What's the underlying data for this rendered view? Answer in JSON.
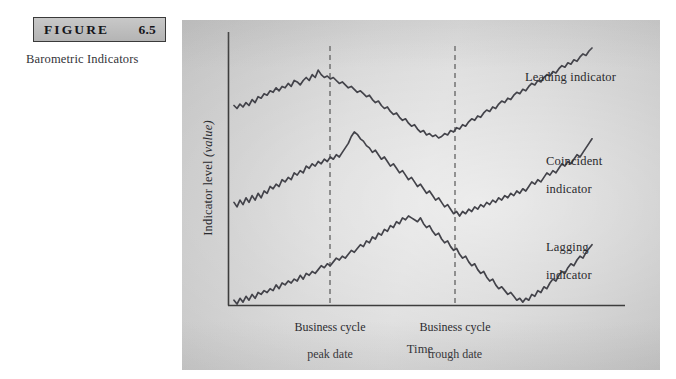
{
  "figure": {
    "header_word": "FIGURE",
    "number": "6.5",
    "caption": "Barometric Indicators"
  },
  "chart_data": {
    "type": "line",
    "title": "Barometric Indicators",
    "xlabel": "Time",
    "ylabel": "Indicator level (value)",
    "ylabel_plain": "Indicator level",
    "ylabel_italic": "(value)",
    "grid": false,
    "legend_position": "right-inline",
    "axis": {
      "x_range_note": "unlabeled time axis",
      "y_range_note": "unlabeled indicator level axis",
      "tick_labels": []
    },
    "annotations": [
      {
        "name": "business-cycle-peak",
        "label": "Business cycle\npeak date",
        "line1": "Business cycle",
        "line2": "peak date",
        "x_fraction": 0.256,
        "style": "dashed-vertical"
      },
      {
        "name": "business-cycle-trough",
        "label": "Business cycle\ntrough date",
        "line1": "Business cycle",
        "line2": "trough date",
        "x_fraction": 0.568,
        "style": "dashed-vertical"
      }
    ],
    "series": [
      {
        "name": "Leading indicator",
        "label_line1": "Leading indicator",
        "label_line2": "",
        "turning_points": {
          "peak_x_fraction": 0.17,
          "trough_x_fraction": 0.44
        },
        "note": "Peaks and troughs before the business cycle reference dates",
        "values": [
          76,
          74,
          77,
          75,
          78,
          76,
          80,
          78,
          82,
          81,
          84,
          83,
          86,
          85,
          88,
          86,
          89,
          88,
          91,
          89,
          93,
          92,
          90,
          93,
          95,
          93,
          97,
          95,
          100,
          97,
          95,
          96,
          94,
          95,
          93,
          91,
          92,
          90,
          88,
          89,
          87,
          85,
          86,
          84,
          82,
          83,
          80,
          78,
          79,
          76,
          74,
          75,
          72,
          70,
          71,
          68,
          66,
          67,
          64,
          62,
          63,
          60,
          58,
          59,
          56,
          57,
          55,
          56,
          54,
          55,
          57,
          56,
          59,
          58,
          61,
          60,
          63,
          62,
          65,
          67,
          66,
          69,
          68,
          71,
          73,
          72,
          75,
          74,
          77,
          79,
          78,
          81,
          80,
          83,
          85,
          84,
          87,
          86,
          89,
          91,
          90,
          93,
          92,
          95,
          97,
          96,
          99,
          98,
          101,
          103,
          102,
          105,
          104,
          107,
          106,
          109,
          111,
          110,
          113,
          115
        ]
      },
      {
        "name": "Coincident indicator",
        "label_line1": "Coincident",
        "label_line2": "indicator",
        "turning_points": {
          "peak_x_fraction": 0.256,
          "trough_x_fraction": 0.568
        },
        "note": "Peaks and troughs coincide with the business cycle reference dates",
        "values": [
          54,
          52,
          55,
          53,
          56,
          54,
          57,
          55,
          58,
          56,
          59,
          58,
          61,
          60,
          62,
          61,
          64,
          63,
          65,
          64,
          67,
          66,
          68,
          67,
          70,
          69,
          71,
          70,
          72,
          71,
          73,
          72,
          74,
          73,
          75,
          74,
          76,
          78,
          80,
          83,
          85,
          84,
          82,
          81,
          79,
          78,
          76,
          77,
          75,
          73,
          74,
          72,
          70,
          71,
          69,
          67,
          68,
          66,
          64,
          65,
          63,
          61,
          62,
          60,
          58,
          59,
          57,
          55,
          56,
          54,
          52,
          53,
          51,
          49,
          50,
          48,
          50,
          49,
          51,
          50,
          52,
          51,
          53,
          52,
          54,
          53,
          55,
          54,
          56,
          55,
          57,
          56,
          58,
          57,
          59,
          58,
          60,
          59,
          61,
          63,
          62,
          64,
          63,
          65,
          67,
          66,
          68,
          67,
          69,
          71,
          70,
          72,
          71,
          73,
          75,
          74,
          76,
          78,
          80,
          82
        ]
      },
      {
        "name": "Lagging indicator",
        "label_line1": "Lagging",
        "label_line2": "indicator",
        "turning_points": {
          "peak_x_fraction": 0.4,
          "trough_x_fraction": 0.7
        },
        "note": "Peaks and troughs after the business cycle reference dates",
        "values": [
          42,
          40,
          43,
          41,
          44,
          42,
          45,
          43,
          46,
          45,
          47,
          46,
          48,
          47,
          50,
          48,
          51,
          50,
          52,
          51,
          53,
          52,
          55,
          53,
          56,
          55,
          57,
          56,
          58,
          60,
          59,
          61,
          60,
          62,
          64,
          63,
          65,
          64,
          66,
          68,
          67,
          69,
          71,
          70,
          73,
          72,
          75,
          74,
          77,
          76,
          79,
          78,
          81,
          80,
          83,
          82,
          85,
          84,
          86,
          85,
          84,
          83,
          85,
          82,
          80,
          81,
          78,
          76,
          77,
          74,
          72,
          73,
          70,
          68,
          69,
          66,
          64,
          65,
          62,
          60,
          61,
          58,
          56,
          57,
          54,
          52,
          53,
          50,
          48,
          49,
          47,
          45,
          46,
          44,
          42,
          43,
          41,
          43,
          42,
          45,
          44,
          47,
          46,
          49,
          48,
          51,
          53,
          52,
          55,
          57,
          56,
          59,
          61,
          60,
          63,
          65,
          64,
          67,
          69,
          71
        ]
      }
    ]
  }
}
